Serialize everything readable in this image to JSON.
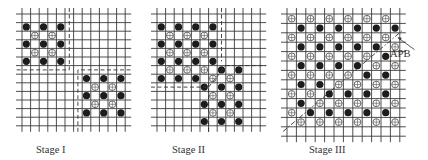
{
  "figure": {
    "legend": {
      "filled_circle": "atom species A (ordered sublattice 1)",
      "open_circle": "atom species B (ordered sublattice 2)"
    },
    "panels": [
      {
        "id": "stage1",
        "caption": "Stage I",
        "domains": [
          {
            "name": "upper-left domain",
            "filled": [
              [
                1,
                2
              ],
              [
                3,
                2
              ],
              [
                5,
                2
              ],
              [
                1,
                4
              ],
              [
                3,
                4
              ],
              [
                5,
                4
              ],
              [
                1,
                6
              ],
              [
                3,
                6
              ],
              [
                5,
                6
              ]
            ],
            "open": [
              [
                2,
                3
              ],
              [
                4,
                3
              ],
              [
                2,
                5
              ],
              [
                4,
                5
              ]
            ]
          },
          {
            "name": "lower-right domain",
            "filled": [
              [
                8,
                8
              ],
              [
                10,
                8
              ],
              [
                12,
                8
              ],
              [
                8,
                10
              ],
              [
                10,
                10
              ],
              [
                12,
                10
              ],
              [
                8,
                12
              ],
              [
                10,
                12
              ],
              [
                12,
                12
              ]
            ],
            "open": [
              [
                9,
                9
              ],
              [
                11,
                9
              ],
              [
                9,
                11
              ],
              [
                11,
                11
              ]
            ]
          }
        ]
      },
      {
        "id": "stage2",
        "caption": "Stage II",
        "domains": [
          {
            "name": "upper-left domain",
            "filled": [
              [
                1,
                2
              ],
              [
                3,
                2
              ],
              [
                5,
                2
              ],
              [
                7,
                2
              ],
              [
                1,
                4
              ],
              [
                3,
                4
              ],
              [
                5,
                4
              ],
              [
                7,
                4
              ],
              [
                1,
                6
              ],
              [
                3,
                6
              ],
              [
                5,
                6
              ],
              [
                7,
                6
              ],
              [
                1,
                8
              ],
              [
                3,
                8
              ],
              [
                5,
                8
              ]
            ],
            "open": [
              [
                2,
                3
              ],
              [
                4,
                3
              ],
              [
                6,
                3
              ],
              [
                2,
                5
              ],
              [
                4,
                5
              ],
              [
                6,
                5
              ],
              [
                2,
                7
              ],
              [
                4,
                7
              ],
              [
                6,
                7
              ]
            ]
          },
          {
            "name": "lower-right domain",
            "filled": [
              [
                8,
                7
              ],
              [
                10,
                7
              ],
              [
                6,
                9
              ],
              [
                8,
                9
              ],
              [
                10,
                9
              ],
              [
                6,
                11
              ],
              [
                8,
                11
              ],
              [
                10,
                11
              ],
              [
                6,
                13
              ],
              [
                8,
                13
              ],
              [
                10,
                13
              ]
            ],
            "open": [
              [
                7,
                8
              ],
              [
                9,
                8
              ],
              [
                7,
                10
              ],
              [
                9,
                10
              ],
              [
                7,
                12
              ],
              [
                9,
                12
              ]
            ]
          }
        ]
      },
      {
        "id": "stage3",
        "caption": "Stage III",
        "annotation": "APB",
        "annotation_meaning": "antiphase boundary"
      }
    ]
  }
}
